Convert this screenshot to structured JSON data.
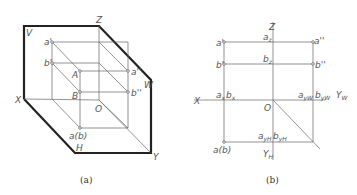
{
  "figure_a": {
    "caption": "(a)",
    "planes": {
      "V": "V",
      "H": "H",
      "W": "W"
    },
    "axes": {
      "X": "X",
      "Y": "Y",
      "Z": "Z",
      "O": "O"
    },
    "points": {
      "a_v": "a'",
      "b_v": "b'",
      "A": "A",
      "B": "B",
      "a_w": "a''",
      "b_w": "b''",
      "ab_h": "a(b)"
    }
  },
  "figure_b": {
    "caption": "(b)",
    "axes": {
      "X": "X",
      "Z": "Z",
      "O": "O",
      "Yw": "Y",
      "Yw_sub": "W",
      "Yh": "Y",
      "Yh_sub": "H"
    },
    "points": {
      "a_v": "a'",
      "b_v": "b'",
      "a_w": "a''",
      "b_w": "b''",
      "ab_h": "a(b)",
      "az": "a",
      "az_sub": "z",
      "bz": "b",
      "bz_sub": "z",
      "ax": "a",
      "ax_sub": "x",
      "bx": "b",
      "bx_sub": "x",
      "ayw": "a",
      "ayw_sub": "yW",
      "byw": "b",
      "byw_sub": "yW",
      "ayh": "a",
      "ayh_sub": "yH",
      "byh": "b",
      "byh_sub": "yH"
    }
  }
}
